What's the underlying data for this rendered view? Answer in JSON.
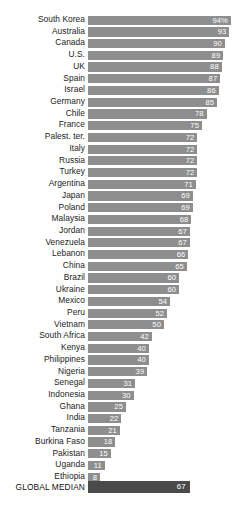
{
  "chart_data": {
    "type": "bar",
    "title": "",
    "subtitle": "",
    "xlabel": "",
    "ylabel": "",
    "orientation": "horizontal",
    "grid": false,
    "legend": false,
    "xlim": [
      0,
      100
    ],
    "value_suffix_first_row": "%",
    "max_value": 94,
    "colors": {
      "bar": "#8e8e8e",
      "median_bar": "#4a4a4a",
      "value_text": "#ffffff",
      "label_text": "#1b1b1b",
      "background": "#ffffff"
    },
    "categories": [
      "South Korea",
      "Australia",
      "Canada",
      "U.S.",
      "UK",
      "Spain",
      "Israel",
      "Germany",
      "Chile",
      "France",
      "Palest. ter.",
      "Italy",
      "Russia",
      "Turkey",
      "Argentina",
      "Japan",
      "Poland",
      "Malaysia",
      "Jordan",
      "Venezuela",
      "Lebanon",
      "China",
      "Brazil",
      "Ukraine",
      "Mexico",
      "Peru",
      "Vietnam",
      "South Africa",
      "Kenya",
      "Philippines",
      "Nigeria",
      "Senegal",
      "Indonesia",
      "Ghana",
      "India",
      "Tanzania",
      "Burkina Faso",
      "Pakistan",
      "Uganda",
      "Ethiopia"
    ],
    "values": [
      94,
      93,
      90,
      89,
      88,
      87,
      86,
      85,
      78,
      75,
      72,
      72,
      72,
      72,
      71,
      69,
      69,
      68,
      67,
      67,
      66,
      65,
      60,
      60,
      54,
      52,
      50,
      42,
      40,
      40,
      39,
      31,
      30,
      25,
      22,
      21,
      18,
      15,
      11,
      8
    ],
    "value_labels": [
      "94%",
      "93",
      "90",
      "89",
      "88",
      "87",
      "86",
      "85",
      "78",
      "75",
      "72",
      "72",
      "72",
      "72",
      "71",
      "69",
      "69",
      "68",
      "67",
      "67",
      "66",
      "65",
      "60",
      "60",
      "54",
      "52",
      "50",
      "42",
      "40",
      "40",
      "39",
      "31",
      "30",
      "25",
      "22",
      "21",
      "18",
      "15",
      "11",
      "8"
    ],
    "summary_row": {
      "label": "GLOBAL MEDIAN",
      "value": 67,
      "value_label": "67"
    }
  }
}
